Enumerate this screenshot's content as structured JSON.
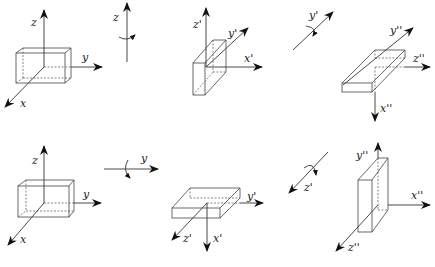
{
  "figure": {
    "rows": [
      {
        "name": "top-row",
        "frames": [
          {
            "axes": {
              "z": "z",
              "y": "y",
              "x": "x"
            }
          },
          {
            "rotation_axis": "z"
          },
          {
            "axes": {
              "z": "z'",
              "y": "y'",
              "x": "x'"
            }
          },
          {
            "rotation_axis": "y'"
          },
          {
            "axes": {
              "y": "y''",
              "z": "z''",
              "x": "x''"
            }
          }
        ]
      },
      {
        "name": "bottom-row",
        "frames": [
          {
            "axes": {
              "z": "z",
              "y": "y",
              "x": "x"
            }
          },
          {
            "rotation_axis": "y"
          },
          {
            "axes": {
              "y": "y'",
              "z": "z'",
              "x": "x'"
            }
          },
          {
            "rotation_axis": "z'"
          },
          {
            "axes": {
              "y": "y''",
              "x": "x''",
              "z": "z''"
            }
          }
        ]
      }
    ]
  },
  "labels": {
    "t1_z": "z",
    "t1_y": "y",
    "t1_x": "x",
    "t_rot1": "z",
    "t2_z": "z'",
    "t2_y": "y'",
    "t2_x": "x'",
    "t_rot2": "y'",
    "t3_y": "y''",
    "t3_z": "z''",
    "t3_x": "x''",
    "b1_z": "z",
    "b1_y": "y",
    "b1_x": "x",
    "b_rot1": "y",
    "b2_y": "y'",
    "b2_z": "z'",
    "b2_x": "x'",
    "b_rot2": "z'",
    "b3_y": "y''",
    "b3_x": "x''",
    "b3_z": "z''"
  }
}
